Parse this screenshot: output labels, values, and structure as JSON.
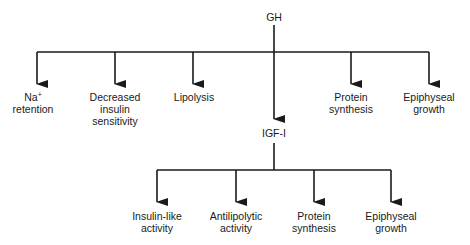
{
  "diagram": {
    "root": {
      "label": "GH"
    },
    "gh_effects": [
      {
        "lines": [
          "Na+",
          "retention"
        ]
      },
      {
        "lines": [
          "Decreased",
          "insulin",
          "sensitivity"
        ]
      },
      {
        "lines": [
          "Lipolysis"
        ]
      },
      {
        "lines": [
          "Protein",
          "synthesis"
        ]
      },
      {
        "lines": [
          "Epiphyseal",
          "growth"
        ]
      }
    ],
    "mediator": {
      "label": "IGF-I"
    },
    "igf_effects": [
      {
        "lines": [
          "Insulin-like",
          "activity"
        ]
      },
      {
        "lines": [
          "Antilipolytic",
          "activity"
        ]
      },
      {
        "lines": [
          "Protein",
          "synthesis"
        ]
      },
      {
        "lines": [
          "Epiphyseal",
          "growth"
        ]
      }
    ],
    "colors": {
      "line": "#1a1a1a",
      "text": "#1a1a1a",
      "background": "#ffffff"
    }
  }
}
